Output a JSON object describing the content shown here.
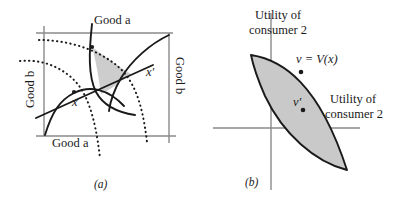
{
  "figure": {
    "width": 406,
    "height": 203,
    "background": "#ffffff",
    "ink": "#1a1a1a",
    "axis_gray": "#8a8a8a",
    "shade_fill": "#c9c9c9"
  },
  "panel_a": {
    "tag": "(a)",
    "type": "edgeworth-box",
    "labels": {
      "top_axis": "Good a",
      "bottom_axis": "Good a",
      "left_axis": "Good b",
      "right_axis": "Good b",
      "allocation_x": "x",
      "allocation_x_prime": "x′"
    },
    "description": "Edgeworth box with two pairs of indifference curves; the shaded lens is the set of allocations preferred by both consumers to x.",
    "curves": [
      {
        "name": "consumer-1-indifference-through-x",
        "style": "solid"
      },
      {
        "name": "consumer-1-indifference-through-x-prime",
        "style": "solid"
      },
      {
        "name": "consumer-2-indifference-through-x",
        "style": "dotted"
      },
      {
        "name": "consumer-2-indifference-through-x-prime",
        "style": "dotted"
      },
      {
        "name": "contract-line",
        "style": "solid"
      }
    ]
  },
  "panel_b": {
    "tag": "(b)",
    "type": "utility-possibility-set",
    "labels": {
      "vertical_axis": "Utility of\nconsumer 2",
      "vertical_axis_line1": "Utility of",
      "vertical_axis_line2": "consumer 2",
      "horizontal_axis_line1": "Utility of",
      "horizontal_axis_line2": "consumer 2",
      "point_v": "v = V(x)",
      "point_v_prime": "v′"
    },
    "description": "Lens-shaped shaded utility set with boundary point v = V(x) and interior point v-prime.",
    "points": [
      {
        "name": "v",
        "label": "v = V(x)",
        "on_boundary": true
      },
      {
        "name": "v-prime",
        "label": "v′",
        "on_boundary": false
      }
    ]
  }
}
